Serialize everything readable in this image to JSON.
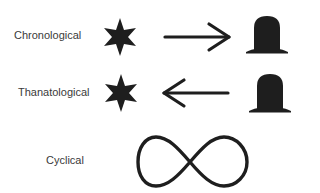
{
  "diagram": {
    "rows": [
      {
        "label": "Chronological",
        "from_icon": "star-icon",
        "arrow": "right-arrow-icon",
        "to_icon": "hat-icon"
      },
      {
        "label": "Thanatological",
        "from_icon": "star-icon",
        "arrow": "left-arrow-icon",
        "to_icon": "hat-icon"
      },
      {
        "label": "Cyclical",
        "icon": "infinity-icon"
      }
    ],
    "colors": {
      "ink": "#1e1e1e",
      "text": "#3a3a3a",
      "background": "#ffffff"
    }
  }
}
